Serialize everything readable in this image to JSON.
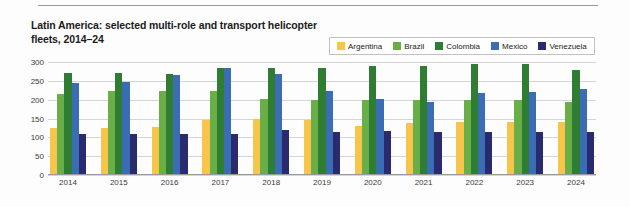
{
  "title": "Latin America: selected multi-role and transport helicopter fleets, 2014–24",
  "legend": {
    "position": "top-right",
    "entries": [
      {
        "label": "Argentina",
        "color": "#F6C54A"
      },
      {
        "label": "Brazil",
        "color": "#6AAE48"
      },
      {
        "label": "Colombia",
        "color": "#2E7D32"
      },
      {
        "label": "Mexico",
        "color": "#3B6DB5"
      },
      {
        "label": "Venezuela",
        "color": "#2A2A6E"
      }
    ]
  },
  "axes": {
    "y_ticks": [
      "300",
      "250",
      "200",
      "150",
      "100",
      "50",
      "0"
    ],
    "x_ticks": [
      "2014",
      "2015",
      "2016",
      "2017",
      "2018",
      "2019",
      "2020",
      "2021",
      "2022",
      "2023",
      "2024"
    ]
  },
  "chart_data": {
    "type": "bar",
    "title": "Latin America: selected multi-role and transport helicopter fleets, 2014–24",
    "xlabel": "",
    "ylabel": "",
    "ylim": [
      0,
      300
    ],
    "ytick_step": 50,
    "grid": true,
    "legend_position": "top-right",
    "categories": [
      "2014",
      "2015",
      "2016",
      "2017",
      "2018",
      "2019",
      "2020",
      "2021",
      "2022",
      "2023",
      "2024"
    ],
    "series": [
      {
        "name": "Argentina",
        "color": "#F6C54A",
        "values": [
          125,
          125,
          128,
          145,
          148,
          145,
          130,
          138,
          140,
          140,
          140
        ]
      },
      {
        "name": "Brazil",
        "color": "#6AAE48",
        "values": [
          215,
          222,
          222,
          222,
          203,
          200,
          200,
          200,
          200,
          200,
          193
        ]
      },
      {
        "name": "Colombia",
        "color": "#2E7D32",
        "values": [
          270,
          270,
          268,
          283,
          285,
          285,
          290,
          290,
          295,
          295,
          280
        ]
      },
      {
        "name": "Mexico",
        "color": "#3B6DB5",
        "values": [
          245,
          248,
          265,
          283,
          268,
          222,
          202,
          195,
          218,
          220,
          228
        ]
      },
      {
        "name": "Venezuela",
        "color": "#2A2A6E",
        "values": [
          110,
          110,
          108,
          108,
          120,
          115,
          118,
          115,
          115,
          115,
          115
        ]
      }
    ]
  }
}
